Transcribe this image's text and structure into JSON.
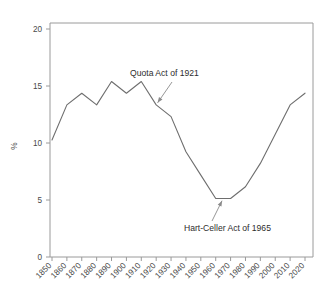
{
  "chart_data": {
    "type": "line",
    "title": "",
    "xlabel": "",
    "ylabel": "%",
    "xlim": [
      1850,
      2020
    ],
    "ylim": [
      0,
      20
    ],
    "grid": false,
    "legend": null,
    "ytick_labels": [
      "20",
      "15",
      "10",
      "5",
      "0"
    ],
    "ytick_values": [
      20,
      15,
      10,
      5,
      0
    ],
    "categories": [
      "1850",
      "1860",
      "1870",
      "1880",
      "1890",
      "1900",
      "1910",
      "1920",
      "1930",
      "1940",
      "1950",
      "1960",
      "1970",
      "1980",
      "1990",
      "2000",
      "2010",
      "2020"
    ],
    "x": [
      1850,
      1860,
      1870,
      1880,
      1890,
      1900,
      1910,
      1920,
      1930,
      1940,
      1950,
      1960,
      1970,
      1980,
      1990,
      2000,
      2010,
      2020
    ],
    "values": [
      10,
      13,
      14,
      13,
      15,
      14,
      15,
      13,
      12,
      9,
      7,
      5,
      5,
      6,
      8,
      10.5,
      13,
      14
    ],
    "series": [
      {
        "name": "Foreign-born share of U.S. population",
        "values": [
          10,
          13,
          14,
          13,
          15,
          14,
          15,
          13,
          12,
          9,
          7,
          5,
          5,
          6,
          8,
          10.5,
          13,
          14
        ]
      }
    ],
    "annotations": [
      {
        "id": "quota-act",
        "label": "Quota Act of 1921",
        "point_x": 1920,
        "point_y": 13
      },
      {
        "id": "hart-celler-act",
        "label": "Hart-Celler Act of 1965",
        "point_x": 1965,
        "point_y": 5
      }
    ],
    "colors": {
      "line": "#6e6e6e",
      "axis": "#9a9a9a",
      "text": "#3a3a3a",
      "annotation": "#2d2d2d",
      "background": "#ffffff"
    }
  }
}
